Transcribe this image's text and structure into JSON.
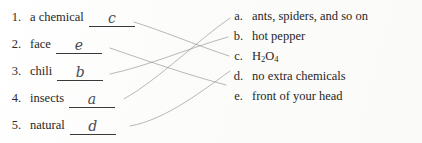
{
  "worksheet": {
    "type": "matching-exercise",
    "left_column": {
      "items": [
        {
          "number": "1.",
          "text": "a chemical",
          "answer": "c"
        },
        {
          "number": "2.",
          "text": "face",
          "answer": "e"
        },
        {
          "number": "3.",
          "text": "chili",
          "answer": "b"
        },
        {
          "number": "4.",
          "text": "insects",
          "answer": "a"
        },
        {
          "number": "5.",
          "text": "natural",
          "answer": "d"
        }
      ]
    },
    "right_column": {
      "options": [
        {
          "letter": "a.",
          "text": "ants, spiders, and so on",
          "formula": null
        },
        {
          "letter": "b.",
          "text": "hot pepper",
          "formula": null
        },
        {
          "letter": "c.",
          "text": "H",
          "formula": {
            "base1": "H",
            "sub1": "2",
            "base2": "O",
            "sub2": "4"
          }
        },
        {
          "letter": "d.",
          "text": "no extra chemicals",
          "formula": null
        },
        {
          "letter": "e.",
          "text": "front of your head",
          "formula": null
        }
      ]
    },
    "connections": [
      {
        "from": "1",
        "to": "c"
      },
      {
        "from": "2",
        "to": "e"
      },
      {
        "from": "3",
        "to": "b"
      },
      {
        "from": "4",
        "to": "a"
      },
      {
        "from": "5",
        "to": "d"
      }
    ],
    "colors": {
      "ink": "#262626",
      "pencil": "#8a8a8a",
      "handwriting": "#4a4a52",
      "paper": "#fdfdfc"
    }
  }
}
